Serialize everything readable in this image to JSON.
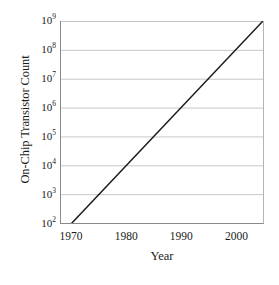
{
  "chart_data": {
    "type": "line",
    "title": "",
    "xlabel": "Year",
    "ylabel": "On-Chip Transistor Count",
    "xlim": [
      1968,
      2005
    ],
    "ylim": [
      100,
      1000000000
    ],
    "yscale": "log",
    "xscale": "linear",
    "grid": "horizontal",
    "legend": "none",
    "xticks": [
      {
        "value": 1970,
        "label": "1970"
      },
      {
        "value": 1980,
        "label": "1980"
      },
      {
        "value": 1990,
        "label": "1990"
      },
      {
        "value": 2000,
        "label": "2000"
      }
    ],
    "yticks": [
      {
        "value": 100,
        "mantissa": "10",
        "exponent": "2"
      },
      {
        "value": 1000,
        "mantissa": "10",
        "exponent": "3"
      },
      {
        "value": 10000,
        "mantissa": "10",
        "exponent": "4"
      },
      {
        "value": 100000,
        "mantissa": "10",
        "exponent": "5"
      },
      {
        "value": 1000000,
        "mantissa": "10",
        "exponent": "6"
      },
      {
        "value": 10000000,
        "mantissa": "10",
        "exponent": "7"
      },
      {
        "value": 100000000,
        "mantissa": "10",
        "exponent": "8"
      },
      {
        "value": 1000000000,
        "mantissa": "10",
        "exponent": "9"
      }
    ],
    "series": [
      {
        "name": "On-Chip Transistor Count",
        "color": "#1a1a1a",
        "x": [
          1970,
          1975,
          1980,
          1985,
          1990,
          1995,
          2000,
          2005
        ],
        "y": [
          100,
          3162,
          100000,
          3162278,
          100000000,
          3162277660,
          100000000000,
          3162277660168
        ],
        "points": [
          {
            "x": 1970,
            "y": 100
          },
          {
            "x": 1975,
            "y": 3162
          },
          {
            "x": 1980,
            "y": 100000
          },
          {
            "x": 1985,
            "y": 3162278
          },
          {
            "x": 1990,
            "y": 100000000
          },
          {
            "x": 2005,
            "y": 1000000000
          }
        ]
      }
    ],
    "line_endpoints": {
      "start": {
        "x": 1970,
        "y": 100
      },
      "end": {
        "x": 2005,
        "y": 1000000000
      }
    },
    "colors": {
      "line": "#1a1a1a",
      "grid": "#c8c8c8",
      "axis": "#8a8a8a",
      "background": "#ffffff",
      "text": "#1a1a1a"
    }
  }
}
